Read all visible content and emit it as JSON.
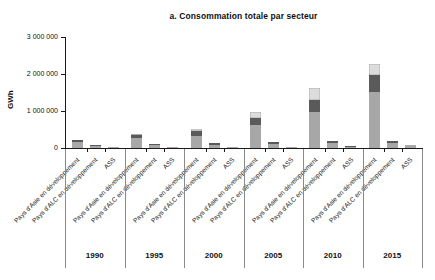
{
  "title": "a. Consommation totale par secteur",
  "y_axis": {
    "label": "GWh",
    "tick_labels": [
      "3 000 000",
      "2 000 000",
      "1 000 000",
      "0"
    ]
  },
  "chart_data": {
    "type": "bar",
    "stacked": true,
    "title": "a. Consommation totale par secteur",
    "ylabel": "GWh",
    "unit": "GWh",
    "ylim": [
      0,
      3000000
    ],
    "yticks": [
      3000000,
      2000000,
      1000000,
      0
    ],
    "ytick_labels": [
      "3 000 000",
      "2 000 000",
      "1 000 000",
      "0"
    ],
    "grid": false,
    "legend": "none",
    "categories": [
      "1990",
      "1995",
      "2000",
      "2005",
      "2010",
      "2015"
    ],
    "sub_categories": [
      "Pays d'Asie en développement",
      "Pays d'ALC en développement",
      "ASS"
    ],
    "segment_colors": [
      "#a7a7a7",
      "#5a5a5a",
      "#dcdcdc"
    ],
    "groups": [
      {
        "year": "1990",
        "bars": [
          {
            "label": "Pays d'Asie en développement",
            "segments": [
              170000,
              40000,
              20000
            ]
          },
          {
            "label": "Pays d'ALC en développement",
            "segments": [
              65000,
              20000,
              5000
            ]
          },
          {
            "label": "ASS",
            "segments": [
              20000,
              5000,
              0
            ]
          }
        ]
      },
      {
        "year": "1995",
        "bars": [
          {
            "label": "Pays d'Asie en développement",
            "segments": [
              270000,
              80000,
              30000
            ]
          },
          {
            "label": "Pays d'ALC en développement",
            "segments": [
              80000,
              25000,
              5000
            ]
          },
          {
            "label": "ASS",
            "segments": [
              20000,
              5000,
              0
            ]
          }
        ]
      },
      {
        "year": "2000",
        "bars": [
          {
            "label": "Pays d'Asie en développement",
            "segments": [
              330000,
              120000,
              70000
            ]
          },
          {
            "label": "Pays d'ALC en développement",
            "segments": [
              95000,
              30000,
              5000
            ]
          },
          {
            "label": "ASS",
            "segments": [
              25000,
              5000,
              0
            ]
          }
        ]
      },
      {
        "year": "2005",
        "bars": [
          {
            "label": "Pays d'Asie en développement",
            "segments": [
              620000,
              180000,
              170000
            ]
          },
          {
            "label": "Pays d'ALC en développement",
            "segments": [
              120000,
              40000,
              10000
            ]
          },
          {
            "label": "ASS",
            "segments": [
              30000,
              10000,
              0
            ]
          }
        ]
      },
      {
        "year": "2010",
        "bars": [
          {
            "label": "Pays d'Asie en développement",
            "segments": [
              980000,
              320000,
              310000
            ]
          },
          {
            "label": "Pays d'ALC en développement",
            "segments": [
              135000,
              45000,
              10000
            ]
          },
          {
            "label": "ASS",
            "segments": [
              35000,
              10000,
              0
            ]
          }
        ]
      },
      {
        "year": "2015",
        "bars": [
          {
            "label": "Pays d'Asie en développement",
            "segments": [
              1520000,
              450000,
              310000
            ]
          },
          {
            "label": "Pays d'ALC en développement",
            "segments": [
              140000,
              50000,
              10000
            ]
          },
          {
            "label": "ASS",
            "segments": [
              50000,
              15000,
              5000
            ]
          }
        ]
      }
    ]
  }
}
